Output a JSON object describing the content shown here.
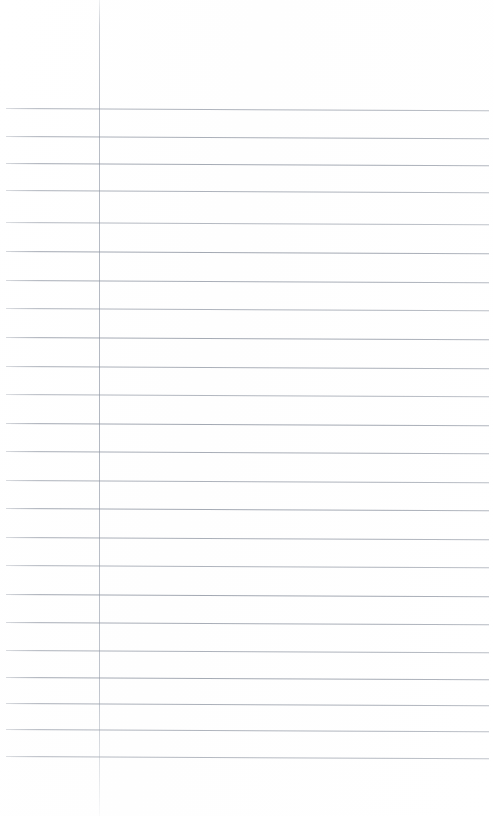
{
  "document": {
    "kind": "lined-notebook-paper-scan",
    "title": "Blank Ruled Paper",
    "page_width": 494,
    "page_height": 816,
    "background_color": "#ffffff",
    "text_content": "",
    "has_handwriting": false,
    "has_printed_text": false
  },
  "margin_rule": {
    "label": "left margin rule",
    "x": 99,
    "top": 0,
    "bottom": 816,
    "color": "#8d95a2",
    "width_px": 1
  },
  "ruling": {
    "label": "horizontal ruled lines",
    "color": "#808896",
    "line_width_px": 1,
    "left_x": 6,
    "right_x": 489,
    "spacing_px": 28,
    "skew_deg": 0.28,
    "count": 24,
    "lines": [
      {
        "y": 108,
        "opacity": 0.62
      },
      {
        "y": 136,
        "opacity": 0.66
      },
      {
        "y": 163,
        "opacity": 0.7
      },
      {
        "y": 190,
        "opacity": 0.64
      },
      {
        "y": 222,
        "opacity": 0.58
      },
      {
        "y": 251,
        "opacity": 0.72
      },
      {
        "y": 280,
        "opacity": 0.68
      },
      {
        "y": 308,
        "opacity": 0.62
      },
      {
        "y": 337,
        "opacity": 0.7
      },
      {
        "y": 366,
        "opacity": 0.66
      },
      {
        "y": 394,
        "opacity": 0.6
      },
      {
        "y": 423,
        "opacity": 0.72
      },
      {
        "y": 451,
        "opacity": 0.68
      },
      {
        "y": 480,
        "opacity": 0.64
      },
      {
        "y": 508,
        "opacity": 0.7
      },
      {
        "y": 537,
        "opacity": 0.66
      },
      {
        "y": 565,
        "opacity": 0.62
      },
      {
        "y": 594,
        "opacity": 0.72
      },
      {
        "y": 622,
        "opacity": 0.68
      },
      {
        "y": 650,
        "opacity": 0.64
      },
      {
        "y": 677,
        "opacity": 0.7
      },
      {
        "y": 703,
        "opacity": 0.66
      },
      {
        "y": 729,
        "opacity": 0.62
      },
      {
        "y": 756,
        "opacity": 0.58
      }
    ]
  }
}
